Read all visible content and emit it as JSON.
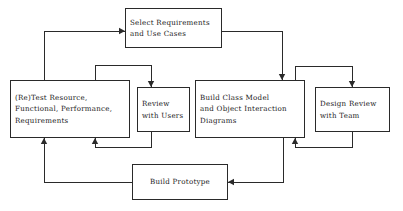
{
  "diagram": {
    "type": "flowchart",
    "canvas": {
      "width": 403,
      "height": 211
    },
    "style": {
      "background_color": "#ffffff",
      "line_color": "#2a2a2a",
      "text_color": "#1a1a1a",
      "border_width": 1
    },
    "nodes": [
      {
        "id": "select-requirements",
        "lines": [
          "Select Requirements",
          "and Use Cases"
        ],
        "x": 125,
        "y": 8,
        "width": 97,
        "height": 40,
        "align": "left"
      },
      {
        "id": "retest-resource",
        "lines": [
          "(Re)Test Resource,",
          "Functional, Performance,",
          "Requirements"
        ],
        "x": 10,
        "y": 80,
        "width": 120,
        "height": 58,
        "align": "left"
      },
      {
        "id": "review-with-users",
        "lines": [
          "Review",
          "with Users"
        ],
        "x": 137,
        "y": 87,
        "width": 53,
        "height": 45,
        "align": "left"
      },
      {
        "id": "build-class-model",
        "lines": [
          "Build Class Model",
          "and Object Interaction",
          "Diagrams"
        ],
        "x": 195,
        "y": 80,
        "width": 110,
        "height": 58,
        "align": "left"
      },
      {
        "id": "design-review",
        "lines": [
          "Design Review",
          "with Team"
        ],
        "x": 315,
        "y": 87,
        "width": 75,
        "height": 45,
        "align": "left"
      },
      {
        "id": "build-prototype",
        "lines": [
          "Build Prototype"
        ],
        "x": 132,
        "y": 164,
        "width": 96,
        "height": 36,
        "align": "center"
      }
    ],
    "connectors": [
      {
        "id": "retest-to-select",
        "from": "retest-resource",
        "to": "select-requirements",
        "points": "44,80 44,31 125,31",
        "arrow_at": "125,31",
        "arrow_dir": "right"
      },
      {
        "id": "select-to-build-class",
        "from": "select-requirements",
        "to": "build-class-model",
        "points": "222,31 282,31 282,80",
        "arrow_at": "282,80",
        "arrow_dir": "down"
      },
      {
        "id": "retest-to-review",
        "from": "retest-resource",
        "to": "review-with-users",
        "points": "95,80 95,65 151,65 151,87",
        "arrow_at": "151,87",
        "arrow_dir": "down"
      },
      {
        "id": "review-to-retest",
        "from": "review-with-users",
        "to": "retest-resource",
        "points": "151,132 151,147 95,147 95,138",
        "arrow_at": "95,138",
        "arrow_dir": "up"
      },
      {
        "id": "build-class-to-design-review",
        "from": "build-class-model",
        "to": "design-review",
        "points": "295,80 295,66 352,66 352,87",
        "arrow_at": "352,87",
        "arrow_dir": "down"
      },
      {
        "id": "design-review-to-build-class",
        "from": "design-review",
        "to": "build-class-model",
        "points": "352,132 352,147 295,147 295,138",
        "arrow_at": "295,138",
        "arrow_dir": "up"
      },
      {
        "id": "build-class-to-prototype",
        "from": "build-class-model",
        "to": "build-prototype",
        "points": "283,138 283,182 228,182",
        "arrow_at": "228,182",
        "arrow_dir": "left"
      },
      {
        "id": "prototype-to-retest",
        "from": "build-prototype",
        "to": "retest-resource",
        "points": "132,182 44,182 44,138",
        "arrow_at": "44,138",
        "arrow_dir": "up"
      }
    ]
  }
}
